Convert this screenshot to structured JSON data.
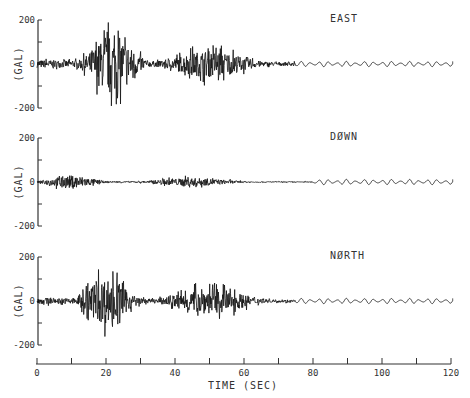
{
  "chart_data": {
    "type": "line",
    "title": "",
    "xlabel": "TIME (SEC)",
    "x_ticks": [
      "0",
      "20",
      "40",
      "60",
      "80",
      "100",
      "120"
    ],
    "xlim": [
      0,
      120
    ],
    "grid": false,
    "panels": [
      {
        "name": "EAST",
        "ylabel": "(GAL)",
        "y_ticks": [
          "200",
          "0",
          "-200"
        ],
        "ylim": [
          -200,
          200
        ],
        "envelope": {
          "peak_time": 22,
          "peak_pos": 215,
          "peak_neg": -240,
          "secondary_peak_time": 50,
          "secondary_amp": 100,
          "decay_end": 75
        }
      },
      {
        "name": "DØWN",
        "ylabel": "(GAL)",
        "y_ticks": [
          "200",
          "0",
          "-200"
        ],
        "ylim": [
          -200,
          200
        ],
        "envelope": {
          "peak_time": 10,
          "peak_pos": 50,
          "peak_neg": -50,
          "secondary_peak_time": 45,
          "secondary_amp": 30,
          "decay_end": 80
        }
      },
      {
        "name": "NØRTH",
        "ylabel": "(GAL)",
        "y_ticks": [
          "200",
          "0",
          "-200"
        ],
        "ylim": [
          -200,
          200
        ],
        "envelope": {
          "peak_time": 20,
          "peak_pos": 170,
          "peak_neg": -215,
          "secondary_peak_time": 50,
          "secondary_amp": 95,
          "decay_end": 75
        }
      }
    ]
  }
}
